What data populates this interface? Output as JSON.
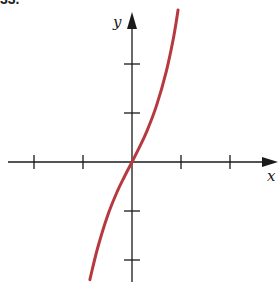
{
  "problem_label": "33.",
  "chart_data": {
    "type": "line",
    "title": "",
    "xlabel": "x",
    "ylabel": "y",
    "xlim": [
      -2.6,
      2.95
    ],
    "ylim": [
      -2.45,
      3.3
    ],
    "x_ticks": [
      -2,
      -1,
      1,
      2
    ],
    "y_ticks": [
      -2,
      -1,
      1,
      2
    ],
    "tick_labels_shown": false,
    "grid": false,
    "series": [
      {
        "name": "f(x)",
        "color": "#b5393f",
        "x": [
          -0.86,
          -0.7,
          -0.5,
          -0.3,
          -0.15,
          0,
          0.15,
          0.3,
          0.5,
          0.7,
          0.85,
          0.94
        ],
        "y": [
          -2.4,
          -1.75,
          -1.1,
          -0.6,
          -0.29,
          0,
          0.3,
          0.62,
          1.15,
          1.85,
          2.55,
          3.1
        ]
      }
    ]
  },
  "colors": {
    "axis": "#1a1a1a",
    "curve": "#b5393f"
  }
}
